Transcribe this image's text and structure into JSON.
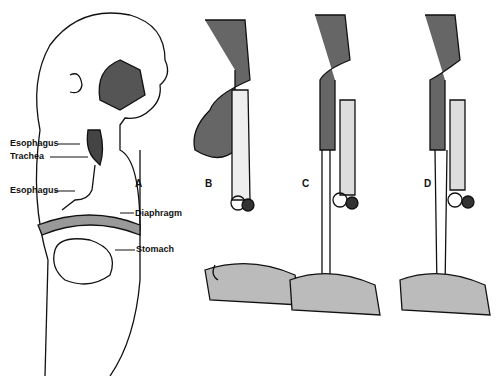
{
  "labels": {
    "esophagus_upper": "Esophagus",
    "trachea": "Trachea",
    "esophagus_lower": "Esophagus",
    "diaphragm": "Diaphragm",
    "stomach": "Stomach"
  },
  "panels": [
    "A",
    "B",
    "C",
    "D"
  ],
  "colors": {
    "ink": "#111111",
    "background": "#ffffff"
  }
}
